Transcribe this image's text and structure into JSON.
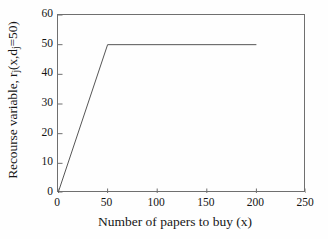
{
  "chart_data": {
    "type": "line",
    "title": "",
    "xlabel": "Number of papers to buy (x)",
    "ylabel_plain": "Recourse variable, rj(x,dj=50)",
    "ylabel_parts": {
      "lead": "Recourse variable, r",
      "sub1": "j",
      "mid": "(x,d",
      "sub2": "j",
      "tail": "=50)"
    },
    "xlim": [
      0,
      250
    ],
    "ylim": [
      0,
      60
    ],
    "xticks": [
      0,
      50,
      100,
      150,
      200,
      250
    ],
    "yticks": [
      0,
      10,
      20,
      30,
      40,
      50,
      60
    ],
    "xtick_labels": [
      "0",
      "50",
      "100",
      "150",
      "200",
      "250"
    ],
    "ytick_labels": [
      "0",
      "10",
      "20",
      "30",
      "40",
      "50",
      "60"
    ],
    "grid": false,
    "legend": false,
    "frame": "box",
    "tick_direction": "in",
    "series": [
      {
        "name": "recourse",
        "x": [
          0,
          50,
          200
        ],
        "y": [
          0,
          50,
          50
        ],
        "color": "#555555",
        "linewidth": 1
      }
    ],
    "annotations": []
  },
  "style": {
    "background": "#fefefe",
    "axis_color": "#6f6f6f",
    "text_color": "#141414",
    "line_color": "#555555"
  }
}
